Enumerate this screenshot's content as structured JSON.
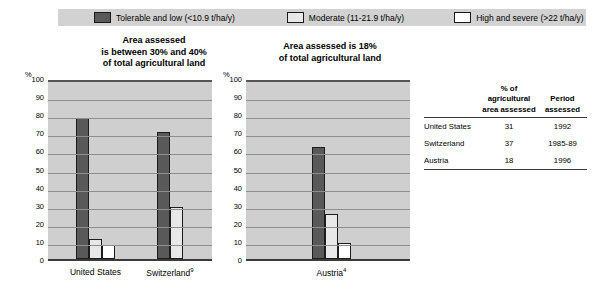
{
  "legend": {
    "items": [
      {
        "key": "tolerable",
        "label": "Tolerable and low (<10.9 t/ha/y)",
        "color": "#595959"
      },
      {
        "key": "moderate",
        "label": "Moderate (11-21.9 t/ha/y)",
        "color": "#e8e8e8"
      },
      {
        "key": "high",
        "label": "High and severe (>22 t/ha/y)",
        "color": "#ffffff"
      }
    ]
  },
  "panels": {
    "left": {
      "title": "Area assessed\nis between 30% and 40%\nof total agricultural land"
    },
    "right": {
      "title": "Area assessed is 18%\nof total agricultural land"
    }
  },
  "axis": {
    "percent_symbol": "%",
    "ticks": [
      0,
      10,
      20,
      30,
      40,
      50,
      60,
      70,
      80,
      90,
      100
    ]
  },
  "chart_data": [
    {
      "type": "bar",
      "title": "Area assessed is between 30% and 40% of total agricultural land",
      "xlabel": "",
      "ylabel": "%",
      "ylim": [
        0,
        100
      ],
      "grid": true,
      "legend_position": "top",
      "categories": [
        "United States",
        "Switzerland⁹"
      ],
      "series": [
        {
          "name": "Tolerable and low (<10.9 t/ha/y)",
          "values": [
            78,
            70
          ]
        },
        {
          "name": "Moderate (11-21.9 t/ha/y)",
          "values": [
            11,
            29
          ]
        },
        {
          "name": "High and severe (>22 t/ha/y)",
          "values": [
            8,
            null
          ]
        }
      ]
    },
    {
      "type": "bar",
      "title": "Area assessed is 18% of total agricultural land",
      "xlabel": "",
      "ylabel": "%",
      "ylim": [
        0,
        100
      ],
      "grid": true,
      "legend_position": "top",
      "categories": [
        "Austria⁴"
      ],
      "series": [
        {
          "name": "Tolerable and low (<10.9 t/ha/y)",
          "values": [
            62
          ]
        },
        {
          "name": "Moderate (11-21.9 t/ha/y)",
          "values": [
            25
          ]
        },
        {
          "name": "High and severe (>22 t/ha/y)",
          "values": [
            9
          ]
        }
      ]
    }
  ],
  "table": {
    "headers": [
      "",
      "% of agricultural\narea assessed",
      "Period\nassessed"
    ],
    "header_lines": {
      "pct_line1": "% of agricultural",
      "pct_line2": "area assessed",
      "per_line1": "Period",
      "per_line2": "assessed"
    },
    "rows": [
      {
        "name": "United States",
        "pct": "31",
        "period": "1992"
      },
      {
        "name": "Switzerland",
        "pct": "37",
        "period": "1985-89"
      },
      {
        "name": "Austria",
        "pct": "18",
        "period": "1996"
      }
    ]
  },
  "colors": {
    "legend_bar_bg": "#d2d2d2",
    "plot_bg": "#cfcfcf",
    "gridline": "#8e8e8e",
    "tolerable": "#595959",
    "moderate": "#e8e8e8",
    "high": "#ffffff"
  }
}
